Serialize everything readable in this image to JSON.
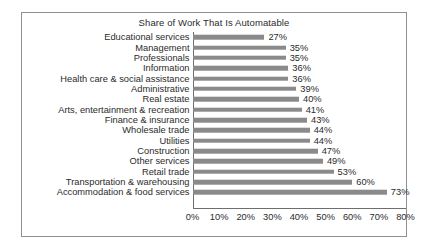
{
  "chart_data": {
    "type": "bar",
    "orientation": "horizontal",
    "title": "Share of Work That Is Automatable",
    "xlabel": "",
    "ylabel": "",
    "xlim": [
      0,
      80
    ],
    "xtick_labels": [
      "0%",
      "10%",
      "20%",
      "30%",
      "40%",
      "50%",
      "60%",
      "70%",
      "80%"
    ],
    "xticks": [
      0,
      10,
      20,
      30,
      40,
      50,
      60,
      70,
      80
    ],
    "grid": false,
    "legend": false,
    "bar_color": "#8a8a8a",
    "categories": [
      "Educational services",
      "Management",
      "Professionals",
      "Information",
      "Health care & social assistance",
      "Administrative",
      "Real estate",
      "Arts, entertainment & recreation",
      "Finance & insurance",
      "Wholesale trade",
      "Utilities",
      "Construction",
      "Other services",
      "Retail trade",
      "Transportation & warehousing",
      "Accommodation & food services"
    ],
    "values": [
      27,
      35,
      35,
      36,
      36,
      39,
      40,
      41,
      43,
      44,
      44,
      47,
      49,
      53,
      60,
      73
    ],
    "value_labels": [
      "27%",
      "35%",
      "35%",
      "36%",
      "36%",
      "39%",
      "40%",
      "41%",
      "43%",
      "44%",
      "44%",
      "47%",
      "49%",
      "53%",
      "60%",
      "73%"
    ]
  }
}
